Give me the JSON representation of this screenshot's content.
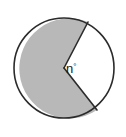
{
  "figure": {
    "canvas": {
      "width": 126,
      "height": 137,
      "background_color": "#ffffff"
    },
    "circle": {
      "center_x": 64,
      "center_y": 68,
      "radius": 50,
      "stroke_color": "#2b2b2b",
      "stroke_width": 1.6
    },
    "sectors": [
      {
        "name": "shaded-major-sector",
        "fill_color": "#b8b8b8",
        "approx_angle_degrees": 238,
        "is_labeled": false
      },
      {
        "name": "white-minor-sector",
        "fill_color": "#ffffff",
        "approx_angle_degrees": 122,
        "is_labeled": true
      }
    ],
    "radii": [
      {
        "name": "upper-radius",
        "end_x": 88,
        "end_y": 22,
        "bearing_degrees": 62
      },
      {
        "name": "lower-radius",
        "end_x": 97,
        "end_y": 110,
        "bearing_degrees": -60
      }
    ],
    "angle_label": {
      "variable": "n",
      "degree_symbol": "°",
      "full_text": "n°",
      "x": 66,
      "y": 72,
      "color": "#1a1a1a"
    }
  }
}
